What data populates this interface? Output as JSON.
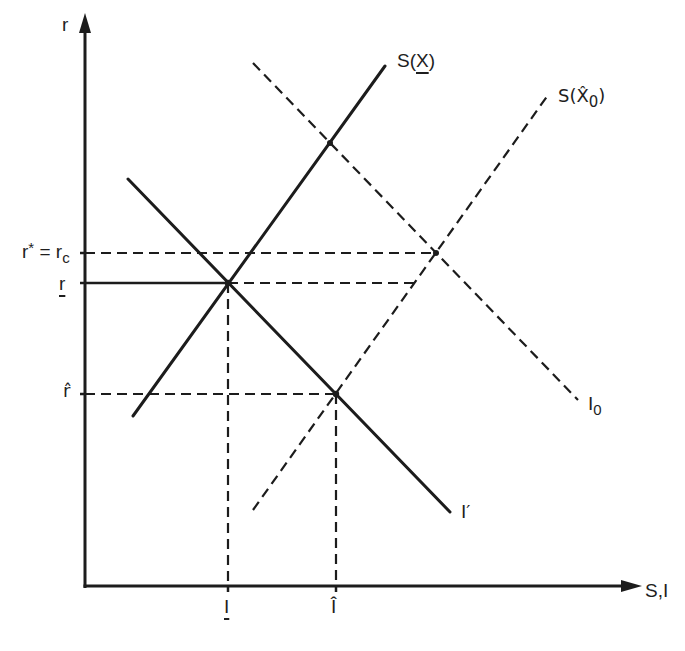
{
  "diagram": {
    "type": "economics saving-investment diagram",
    "y_axis": {
      "label": "r"
    },
    "x_axis": {
      "label": "S,I"
    },
    "curves": {
      "saving_x": {
        "label_prefix": "S(",
        "label_var": "X",
        "label_suffix": ")",
        "line_style": "solid",
        "slope": "upward"
      },
      "saving_x0_hat": {
        "label_prefix": "S(",
        "label_var": "X̂",
        "label_sub": "0",
        "label_suffix": ")",
        "line_style": "dashed",
        "slope": "upward"
      },
      "investment_0": {
        "label_var": "I",
        "label_sub": "0",
        "line_style": "dashed",
        "slope": "downward"
      },
      "investment_prime": {
        "label": "I′",
        "line_style": "solid",
        "slope": "downward"
      }
    },
    "y_levels": {
      "r_star": {
        "label_main": "r",
        "label_sup": "*",
        "label_eq": " = r",
        "label_sub": "c",
        "line_style": "dashed"
      },
      "r_under": {
        "label": "r",
        "line_style": "solid-then-dashed"
      },
      "r_hat": {
        "label": "r̂",
        "line_style": "dashed"
      }
    },
    "x_levels": {
      "i_under": {
        "label": "I",
        "line_style": "dashed"
      },
      "i_hat": {
        "label": "Î",
        "line_style": "dashed"
      }
    }
  }
}
